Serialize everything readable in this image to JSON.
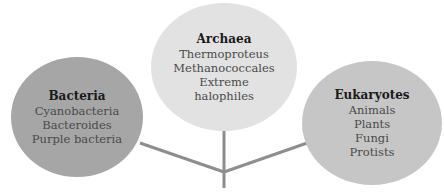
{
  "diagram": {
    "colors": {
      "line": "#8e8e8e",
      "bacteria_fill": "#a6a6a6",
      "archaea_fill": "#e2e2e2",
      "eukaryotes_fill": "#c6c6c6"
    },
    "nodes": [
      {
        "id": "bacteria",
        "title": "Bacteria",
        "items": [
          "Cyanobacteria",
          "Bacteroides",
          "Purple bacteria"
        ]
      },
      {
        "id": "archaea",
        "title": "Archaea",
        "items": [
          "Thermoproteus",
          "Methanococcales",
          "Extreme",
          "halophiles"
        ]
      },
      {
        "id": "eukaryotes",
        "title": "Eukaryotes",
        "items": [
          "Animals",
          "Plants",
          "Fungi",
          "Protists"
        ]
      }
    ]
  }
}
